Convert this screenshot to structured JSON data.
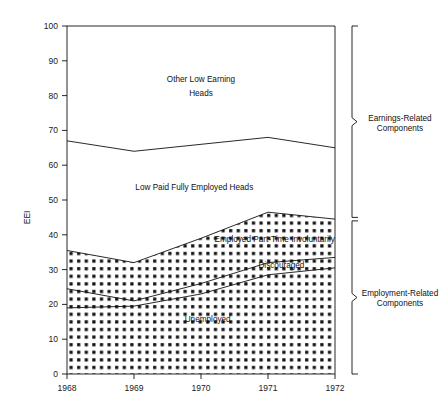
{
  "chart_data": {
    "type": "area",
    "title": "",
    "subtitle": "",
    "xlabel": "",
    "ylabel": "EEI",
    "x": [
      1968,
      1969,
      1970,
      1971,
      1972
    ],
    "xtick_labels": [
      "1968",
      "1969",
      "1970",
      "1971",
      "1972"
    ],
    "ytick_labels": [
      "0",
      "10",
      "20",
      "30",
      "40",
      "50",
      "60",
      "70",
      "80",
      "90",
      "100"
    ],
    "ytick_values": [
      0,
      10,
      20,
      30,
      40,
      50,
      60,
      70,
      80,
      90,
      100
    ],
    "ylim": [
      0,
      100
    ],
    "xlim": [
      1968,
      1972
    ],
    "grid": false,
    "legend_position": "inline-labels",
    "stacked_boundaries": {
      "top_of_chart": [
        100,
        100,
        100,
        100,
        100
      ],
      "other_low_earning_heads_lower": [
        67,
        64,
        66,
        68,
        65
      ],
      "low_paid_fully_employed_heads_lower": [
        35.5,
        32,
        39,
        46.5,
        44.5
      ],
      "employed_part_time_involuntarily_lower": [
        24.5,
        21,
        26,
        32,
        33.5
      ],
      "discouraged_lower": [
        19,
        19.5,
        23,
        28.5,
        30.5
      ],
      "unemployed_lower": [
        0,
        0,
        0,
        0,
        0
      ]
    },
    "series": [
      {
        "name": "Other Low Earning Heads",
        "values": [
          33,
          36,
          34,
          32,
          35
        ],
        "fill": "white"
      },
      {
        "name": "Low Paid Fully Employed Heads",
        "values": [
          31.5,
          32,
          27,
          21.5,
          20.5
        ],
        "fill": "white"
      },
      {
        "name": "Employed Part-Time Involuntarily",
        "values": [
          11,
          11,
          13,
          14.5,
          11
        ],
        "fill": "checkerboard"
      },
      {
        "name": "Discouraged",
        "values": [
          5.5,
          1.5,
          3,
          3.5,
          3
        ],
        "fill": "checkerboard"
      },
      {
        "name": "Unemployed",
        "values": [
          19,
          19.5,
          23,
          28.5,
          30.5
        ],
        "fill": "checkerboard"
      }
    ],
    "area_labels": [
      {
        "text": "Other Low Earning",
        "x": 1970.0,
        "y": 84
      },
      {
        "text": "Heads",
        "x": 1970.0,
        "y": 80
      },
      {
        "text": "Low Paid Fully Employed Heads",
        "x": 1969.9,
        "y": 53
      },
      {
        "text": "Employed Part-Time Involuntarily",
        "x": 1971.1,
        "y": 38
      },
      {
        "text": "Discouraged",
        "x": 1971.2,
        "y": 30.5
      },
      {
        "text": "Unemployed",
        "x": 1970.1,
        "y": 15
      }
    ],
    "brackets": [
      {
        "label_line1": "Earnings-Related",
        "label_line2": "Components",
        "from": 100,
        "to": 45
      },
      {
        "label_line1": "Employment-Related",
        "label_line2": "Components",
        "from": 44,
        "to": 0
      }
    ],
    "colors": {
      "line": "#111111",
      "background": "#ffffff",
      "pattern_fill": "#111111",
      "text": "#111111"
    }
  }
}
